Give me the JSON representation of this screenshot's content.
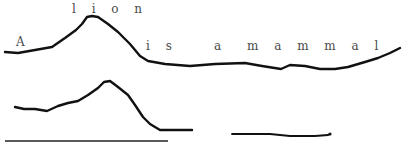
{
  "diagram": {
    "type": "intonation-contour",
    "sentence": {
      "words": [
        {
          "id": "w1",
          "text": "A",
          "x": 16,
          "y": 36
        },
        {
          "id": "w2",
          "text": "l i o n",
          "x": 72,
          "y": 3
        },
        {
          "id": "w3",
          "text": "i s",
          "x": 146,
          "y": 40
        },
        {
          "id": "w4",
          "text": "a",
          "x": 214,
          "y": 40
        },
        {
          "id": "w5",
          "text": "m a m m a l",
          "x": 247,
          "y": 40
        }
      ]
    },
    "contours": [
      {
        "id": "upper-contour",
        "label": "pitch contour of full sentence",
        "color": "#111111",
        "points": [
          [
            5,
            52
          ],
          [
            18,
            53
          ],
          [
            35,
            50
          ],
          [
            52,
            47
          ],
          [
            65,
            38
          ],
          [
            76,
            30
          ],
          [
            82,
            24
          ],
          [
            87,
            17
          ],
          [
            92,
            16
          ],
          [
            98,
            17
          ],
          [
            108,
            24
          ],
          [
            118,
            32
          ],
          [
            130,
            44
          ],
          [
            140,
            56
          ],
          [
            148,
            61
          ],
          [
            165,
            64
          ],
          [
            190,
            66
          ],
          [
            215,
            64
          ],
          [
            245,
            63
          ],
          [
            262,
            66
          ],
          [
            281,
            69
          ],
          [
            290,
            65
          ],
          [
            305,
            66
          ],
          [
            320,
            69
          ],
          [
            335,
            69
          ],
          [
            348,
            67
          ],
          [
            365,
            62
          ],
          [
            378,
            58
          ],
          [
            390,
            53
          ],
          [
            400,
            48
          ]
        ]
      },
      {
        "id": "lower-contour",
        "label": "pitch contour of nuclear segment",
        "color": "#111111",
        "points": [
          [
            15,
            107
          ],
          [
            24,
            109
          ],
          [
            35,
            109
          ],
          [
            47,
            111
          ],
          [
            58,
            106
          ],
          [
            68,
            103
          ],
          [
            78,
            101
          ],
          [
            88,
            95
          ],
          [
            98,
            88
          ],
          [
            104,
            82
          ],
          [
            110,
            81
          ],
          [
            118,
            87
          ],
          [
            128,
            95
          ],
          [
            135,
            105
          ],
          [
            143,
            117
          ],
          [
            150,
            124
          ],
          [
            160,
            130
          ],
          [
            175,
            130
          ],
          [
            192,
            130
          ]
        ]
      }
    ],
    "baselines": [
      {
        "id": "baseline-long",
        "x1": 5,
        "y1": 141,
        "x2": 168,
        "y2": 141,
        "color": "#222222"
      },
      {
        "id": "baseline-short",
        "points": [
          [
            232,
            134
          ],
          [
            270,
            134
          ],
          [
            290,
            136
          ],
          [
            315,
            136
          ],
          [
            328,
            135
          ],
          [
            330,
            134
          ]
        ],
        "color": "#111111"
      }
    ]
  }
}
